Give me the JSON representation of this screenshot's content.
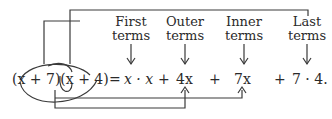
{
  "labels": {
    "first": [
      "First",
      "terms"
    ],
    "outer": [
      "Outer",
      "terms"
    ],
    "inner": [
      "Inner",
      "terms"
    ],
    "last": [
      "Last",
      "terms"
    ]
  },
  "equation": {
    "lhs": "(x + 7)(x + 4)",
    "equals": "=",
    "terms": [
      "x · x",
      "+",
      "4x",
      "+",
      "7x",
      "+",
      "7 · 4."
    ]
  },
  "colors": {
    "stroke": "#3a3a3a",
    "text": "#2a2a2a"
  }
}
